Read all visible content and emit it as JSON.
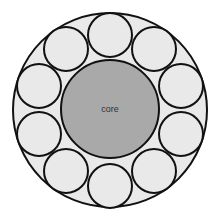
{
  "diagram": {
    "type": "cross-section",
    "core_label": "core",
    "colors": {
      "background": "#ffffff",
      "outer_fill": "#e9e9e9",
      "strand_fill": "#e9e9e9",
      "core_fill": "#a9a9a9",
      "stroke": "#111111"
    },
    "outer": {
      "cx": 110,
      "cy": 110,
      "r": 97
    },
    "core": {
      "cx": 110,
      "cy": 109,
      "r": 49
    },
    "strands": [
      {
        "cx": 110,
        "cy": 35,
        "r": 22
      },
      {
        "cx": 154,
        "cy": 49,
        "r": 22
      },
      {
        "cx": 181,
        "cy": 86,
        "r": 22
      },
      {
        "cx": 181,
        "cy": 134,
        "r": 22
      },
      {
        "cx": 154,
        "cy": 171,
        "r": 22
      },
      {
        "cx": 110,
        "cy": 186,
        "r": 22
      },
      {
        "cx": 66,
        "cy": 171,
        "r": 22
      },
      {
        "cx": 39,
        "cy": 134,
        "r": 22
      },
      {
        "cx": 39,
        "cy": 86,
        "r": 22
      },
      {
        "cx": 66,
        "cy": 49,
        "r": 22
      }
    ]
  }
}
